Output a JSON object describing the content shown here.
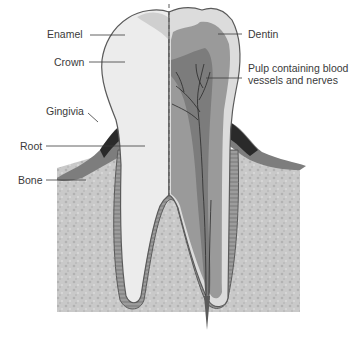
{
  "diagram": {
    "type": "anatomical-cross-section",
    "labels": {
      "enamel": "Enamel",
      "crown": "Crown",
      "gingivia": "Gingivia",
      "root": "Root",
      "bone": "Bone",
      "dentin": "Dentin",
      "pulp": "Pulp containing blood vessels and nerves"
    },
    "colors": {
      "enamel": "#ececec",
      "dentin": "#9a9a9a",
      "pulp": "#7c7c7c",
      "bone": "#c8c8c8",
      "gum": "#7a7a7a",
      "gum_dark": "#2a2a2a",
      "outline": "#5a5a5a",
      "text": "#3a3a3a"
    }
  }
}
